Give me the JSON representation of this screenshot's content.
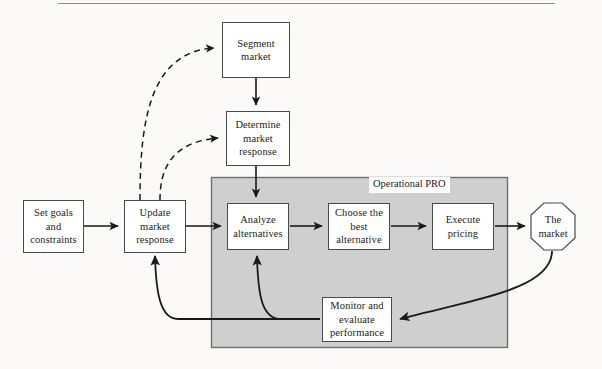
{
  "figure": {
    "title_rule_present": true,
    "container_label": "Operational PRO",
    "colors": {
      "background": "#fbfaf8",
      "panel_fill": "#cfcfcf",
      "panel_border": "#6e6e6e",
      "node_fill": "#ffffff",
      "node_border": "#4a4a4a",
      "line": "#1a1a1a",
      "rule": "#8e8c88"
    }
  },
  "nodes": [
    {
      "id": "segment-market",
      "label": "Segment\nmarket",
      "line1": "Segment",
      "line2": "market",
      "line3": ""
    },
    {
      "id": "determine-market-response",
      "label": "Determine market response",
      "line1": "Determine",
      "line2": "market",
      "line3": "response"
    },
    {
      "id": "set-goals",
      "label": "Set goals and constraints",
      "line1": "Set goals",
      "line2": "and",
      "line3": "constraints"
    },
    {
      "id": "update-market-response",
      "label": "Update market response",
      "line1": "Update",
      "line2": "market",
      "line3": "response"
    },
    {
      "id": "analyze-alternatives",
      "label": "Analyze alternatives",
      "line1": "Analyze",
      "line2": "alternatives",
      "line3": ""
    },
    {
      "id": "choose-best-alternative",
      "label": "Choose the best alternative",
      "line1": "Choose the",
      "line2": "best",
      "line3": "alternative"
    },
    {
      "id": "execute-pricing",
      "label": "Execute pricing",
      "line1": "Execute",
      "line2": "pricing",
      "line3": ""
    },
    {
      "id": "the-market",
      "label": "The market",
      "line1": "The",
      "line2": "market",
      "line3": ""
    },
    {
      "id": "monitor-evaluate",
      "label": "Monitor and evaluate performance",
      "line1": "Monitor and",
      "line2": "evaluate",
      "line3": "performance"
    }
  ],
  "edges": [
    {
      "from": "update-market-response",
      "to": "segment-market",
      "style": "dashed",
      "kind": "curve"
    },
    {
      "from": "update-market-response",
      "to": "determine-market-response",
      "style": "dashed",
      "kind": "curve"
    },
    {
      "from": "segment-market",
      "to": "determine-market-response",
      "style": "solid",
      "kind": "straight"
    },
    {
      "from": "determine-market-response",
      "to": "analyze-alternatives",
      "style": "solid",
      "kind": "straight"
    },
    {
      "from": "set-goals",
      "to": "update-market-response",
      "style": "solid",
      "kind": "straight"
    },
    {
      "from": "update-market-response",
      "to": "analyze-alternatives",
      "style": "solid",
      "kind": "straight"
    },
    {
      "from": "analyze-alternatives",
      "to": "choose-best-alternative",
      "style": "solid",
      "kind": "straight"
    },
    {
      "from": "choose-best-alternative",
      "to": "execute-pricing",
      "style": "solid",
      "kind": "straight"
    },
    {
      "from": "execute-pricing",
      "to": "the-market",
      "style": "solid",
      "kind": "straight"
    },
    {
      "from": "the-market",
      "to": "monitor-evaluate",
      "style": "solid",
      "kind": "curve"
    },
    {
      "from": "monitor-evaluate",
      "to": "analyze-alternatives",
      "style": "solid",
      "kind": "curve"
    },
    {
      "from": "monitor-evaluate",
      "to": "update-market-response",
      "style": "solid",
      "kind": "curve"
    }
  ]
}
